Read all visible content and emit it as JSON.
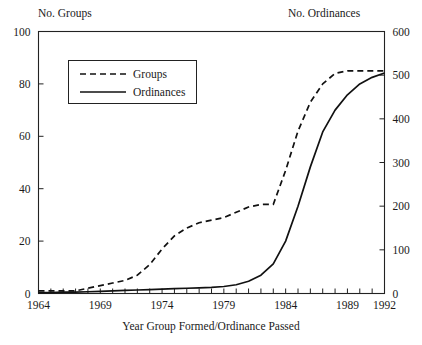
{
  "figure": {
    "left_axis_caption": "No. Groups",
    "right_axis_caption": "No. Ordinances",
    "xlabel": "Year Group Formed/Ordinance Passed"
  },
  "legend": {
    "entries": [
      {
        "label": "Groups",
        "style": "dashed"
      },
      {
        "label": "Ordinances",
        "style": "solid"
      }
    ]
  },
  "chart_data": {
    "type": "line",
    "title": "",
    "subtitle": "",
    "xlabel": "Year Group Formed/Ordinance Passed",
    "ylabel": "No. Groups",
    "y2label": "No. Ordinances",
    "xlim": [
      1964,
      1992
    ],
    "ylim": [
      0,
      100
    ],
    "y2lim": [
      0,
      600
    ],
    "xticks": [
      1964,
      1965,
      1966,
      1967,
      1968,
      1969,
      1970,
      1971,
      1972,
      1973,
      1974,
      1975,
      1976,
      1977,
      1978,
      1979,
      1980,
      1981,
      1982,
      1983,
      1984,
      1985,
      1986,
      1987,
      1988,
      1989,
      1990,
      1991,
      1992
    ],
    "xtick_labels": [
      {
        "value": 1964,
        "label": "1964"
      },
      {
        "value": 1969,
        "label": "1969"
      },
      {
        "value": 1974,
        "label": "1974"
      },
      {
        "value": 1979,
        "label": "1979"
      },
      {
        "value": 1984,
        "label": "1984"
      },
      {
        "value": 1989,
        "label": "1989"
      },
      {
        "value": 1992,
        "label": "1992"
      }
    ],
    "yticks": [
      0,
      20,
      40,
      60,
      80,
      100
    ],
    "ytick_labels": [
      "0",
      "20",
      "40",
      "60",
      "80",
      "100"
    ],
    "y2ticks": [
      0,
      100,
      200,
      300,
      400,
      500,
      600
    ],
    "y2tick_labels": [
      "0",
      "100",
      "200",
      "300",
      "400",
      "500",
      "600"
    ],
    "grid": false,
    "legend_position": "upper left",
    "series": [
      {
        "name": "Groups",
        "axis": "left",
        "style": "dashed",
        "color": "#111111",
        "x": [
          1964,
          1965,
          1966,
          1967,
          1968,
          1969,
          1970,
          1971,
          1972,
          1973,
          1974,
          1975,
          1976,
          1977,
          1978,
          1979,
          1980,
          1981,
          1982,
          1983,
          1984,
          1985,
          1986,
          1987,
          1988,
          1989,
          1990,
          1991,
          1992
        ],
        "values": [
          1,
          1,
          1,
          1,
          2,
          3,
          4,
          5,
          7,
          11,
          17,
          22,
          25,
          27,
          28,
          29,
          31,
          33,
          34,
          34,
          47,
          62,
          73,
          80,
          84,
          85,
          85,
          85,
          85
        ]
      },
      {
        "name": "Ordinances",
        "axis": "right",
        "style": "solid",
        "color": "#111111",
        "x": [
          1964,
          1965,
          1966,
          1967,
          1968,
          1969,
          1970,
          1971,
          1972,
          1973,
          1974,
          1975,
          1976,
          1977,
          1978,
          1979,
          1980,
          1981,
          1982,
          1983,
          1984,
          1985,
          1986,
          1987,
          1988,
          1989,
          1990,
          1991,
          1992
        ],
        "values": [
          2,
          2,
          3,
          3,
          4,
          5,
          6,
          7,
          8,
          9,
          10,
          11,
          12,
          13,
          14,
          16,
          20,
          28,
          42,
          68,
          120,
          200,
          290,
          370,
          420,
          455,
          480,
          495,
          505
        ]
      }
    ]
  }
}
